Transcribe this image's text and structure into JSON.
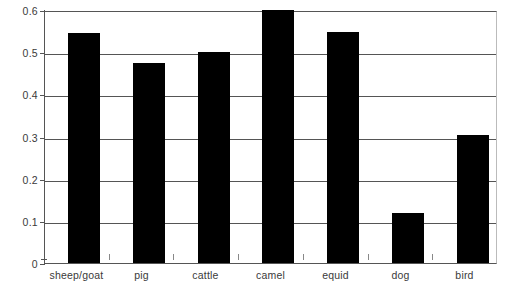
{
  "chart_data": {
    "type": "bar",
    "title": "",
    "subtitle": "",
    "xlabel": "",
    "ylabel": "",
    "categories": [
      "sheep/goat",
      "pig",
      "cattle",
      "camel",
      "equid",
      "dog",
      "bird"
    ],
    "values": [
      0.545,
      0.474,
      0.5,
      0.6,
      0.547,
      0.118,
      0.304
    ],
    "series": [
      {
        "name": "",
        "values": [
          0.545,
          0.474,
          0.5,
          0.6,
          0.547,
          0.118,
          0.304
        ]
      }
    ],
    "ylim": [
      0,
      0.6
    ],
    "ytick_labels": [
      "0",
      "0.1",
      "0.2",
      "0.3",
      "0.4",
      "0.5",
      "0.6"
    ],
    "ytick_values": [
      0,
      0.1,
      0.2,
      0.3,
      0.4,
      0.5,
      0.6
    ],
    "grid": "horizontal",
    "legend": "none",
    "annotations": [],
    "colors": {
      "bar_fill": "#000000",
      "gridline": "#555555",
      "axis": "#555555",
      "plot_border": "#bbbbbb",
      "tick_label": "#3a3a3a",
      "background": "#ffffff"
    }
  }
}
